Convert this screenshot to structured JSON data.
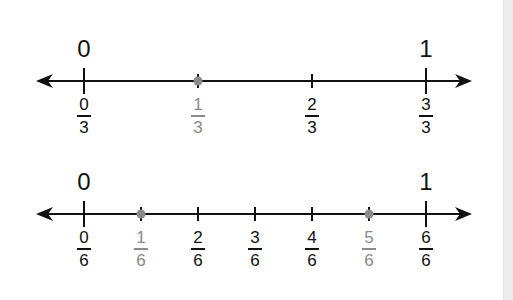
{
  "colors": {
    "line": "#111111",
    "highlight": "#8a8a8a",
    "background": "#ffffff",
    "side_strip": "#ececec"
  },
  "number_lines": [
    {
      "name": "thirds",
      "y": 81,
      "x_start": 36,
      "x_end": 472,
      "x_zero": 84,
      "x_one": 426,
      "whole_labels": {
        "zero": "0",
        "one": "1"
      },
      "denominator": 3,
      "ticks": [
        {
          "num": "0",
          "den": "3",
          "highlight": false
        },
        {
          "num": "1",
          "den": "3",
          "highlight": true
        },
        {
          "num": "2",
          "den": "3",
          "highlight": false
        },
        {
          "num": "3",
          "den": "3",
          "highlight": false
        }
      ]
    },
    {
      "name": "sixths",
      "y": 214,
      "x_start": 36,
      "x_end": 472,
      "x_zero": 84,
      "x_one": 426,
      "whole_labels": {
        "zero": "0",
        "one": "1"
      },
      "denominator": 6,
      "ticks": [
        {
          "num": "0",
          "den": "6",
          "highlight": false
        },
        {
          "num": "1",
          "den": "6",
          "highlight": true
        },
        {
          "num": "2",
          "den": "6",
          "highlight": false
        },
        {
          "num": "3",
          "den": "6",
          "highlight": false
        },
        {
          "num": "4",
          "den": "6",
          "highlight": false
        },
        {
          "num": "5",
          "den": "6",
          "highlight": true
        },
        {
          "num": "6",
          "den": "6",
          "highlight": false
        }
      ]
    }
  ]
}
